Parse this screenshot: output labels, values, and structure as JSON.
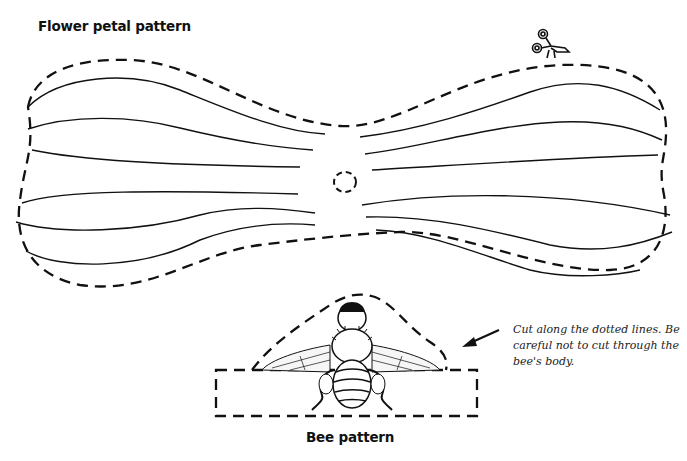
{
  "petal": {
    "title": "Flower petal pattern"
  },
  "bee": {
    "title": "Bee pattern"
  },
  "instruction": {
    "text": "Cut along the dotted lines. Be careful not to cut through the bee's body."
  },
  "icons": {
    "scissors": "scissors-icon",
    "arrow": "arrow-pointer-icon"
  },
  "colors": {
    "ink": "#111111",
    "background": "#ffffff"
  }
}
